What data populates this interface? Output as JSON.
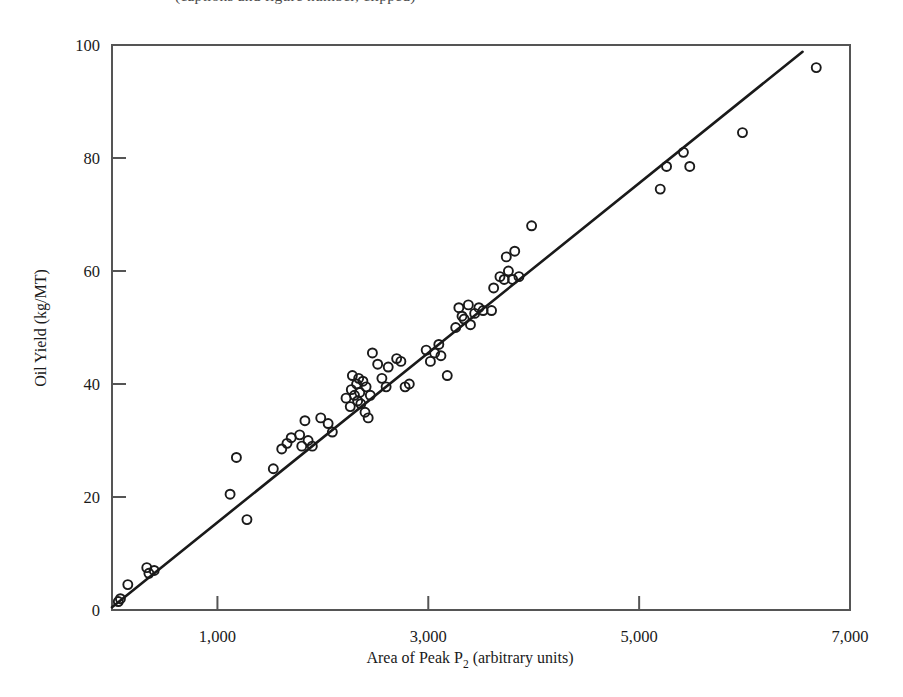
{
  "figure": {
    "partial_caption_above": "(captions and figure number, clipped)",
    "background_color": "#ffffff",
    "marker_color": "#1a1a1a",
    "line_color": "#1a1a1a",
    "frame_color": "#555555"
  },
  "chart_data": {
    "type": "scatter",
    "title": "",
    "xlabel": "Area of Peak P2 (arbitrary units)",
    "xlabel_prefix": "Area of Peak P",
    "xlabel_subscript": "2",
    "xlabel_suffix": " (arbitrary units)",
    "ylabel": "Oil Yield (kg/MT)",
    "xlim": [
      0,
      7000
    ],
    "ylim": [
      0,
      100
    ],
    "xticks": [
      1000,
      3000,
      5000,
      7000
    ],
    "xticklabels": [
      "1,000",
      "3,000",
      "5,000",
      "7,000"
    ],
    "yticks": [
      0,
      20,
      40,
      60,
      80,
      100
    ],
    "yticklabels": [
      "0",
      "20",
      "40",
      "60",
      "80",
      "100"
    ],
    "grid": false,
    "legend": null,
    "marker": "open-circle",
    "marker_size_px": 9,
    "fit_line": {
      "label": "least-squares regression line",
      "x_start": 0,
      "y_start": 0.5,
      "x_end": 6550,
      "y_end": 98.8
    },
    "n_points": 75,
    "points": [
      [
        60,
        1.5
      ],
      [
        80,
        2.0
      ],
      [
        150,
        4.5
      ],
      [
        330,
        7.5
      ],
      [
        350,
        6.5
      ],
      [
        400,
        7.0
      ],
      [
        1120,
        20.5
      ],
      [
        1180,
        27.0
      ],
      [
        1280,
        16.0
      ],
      [
        1530,
        25.0
      ],
      [
        1610,
        28.5
      ],
      [
        1660,
        29.5
      ],
      [
        1700,
        30.5
      ],
      [
        1780,
        31.0
      ],
      [
        1800,
        29.0
      ],
      [
        1830,
        33.5
      ],
      [
        1860,
        30.0
      ],
      [
        1900,
        29.0
      ],
      [
        1980,
        34.0
      ],
      [
        2050,
        33.0
      ],
      [
        2090,
        31.5
      ],
      [
        2220,
        37.5
      ],
      [
        2260,
        36.0
      ],
      [
        2270,
        39.0
      ],
      [
        2280,
        41.5
      ],
      [
        2300,
        38.0
      ],
      [
        2320,
        40.0
      ],
      [
        2330,
        37.0
      ],
      [
        2340,
        41.0
      ],
      [
        2350,
        38.5
      ],
      [
        2360,
        36.5
      ],
      [
        2380,
        40.5
      ],
      [
        2400,
        35.0
      ],
      [
        2410,
        39.5
      ],
      [
        2430,
        34.0
      ],
      [
        2450,
        38.0
      ],
      [
        2470,
        45.5
      ],
      [
        2520,
        43.5
      ],
      [
        2560,
        41.0
      ],
      [
        2600,
        39.5
      ],
      [
        2620,
        43.0
      ],
      [
        2700,
        44.5
      ],
      [
        2740,
        44.0
      ],
      [
        2780,
        39.5
      ],
      [
        2820,
        40.0
      ],
      [
        2980,
        46.0
      ],
      [
        3020,
        44.0
      ],
      [
        3060,
        45.5
      ],
      [
        3100,
        47.0
      ],
      [
        3120,
        45.0
      ],
      [
        3180,
        41.5
      ],
      [
        3260,
        50.0
      ],
      [
        3290,
        53.5
      ],
      [
        3320,
        52.0
      ],
      [
        3340,
        51.5
      ],
      [
        3380,
        54.0
      ],
      [
        3400,
        50.5
      ],
      [
        3440,
        52.5
      ],
      [
        3480,
        53.5
      ],
      [
        3520,
        53.0
      ],
      [
        3600,
        53.0
      ],
      [
        3620,
        57.0
      ],
      [
        3680,
        59.0
      ],
      [
        3720,
        58.5
      ],
      [
        3740,
        62.5
      ],
      [
        3760,
        60.0
      ],
      [
        3800,
        58.5
      ],
      [
        3820,
        63.5
      ],
      [
        3860,
        59.0
      ],
      [
        3980,
        68.0
      ],
      [
        5200,
        74.5
      ],
      [
        5260,
        78.5
      ],
      [
        5420,
        81.0
      ],
      [
        5480,
        78.5
      ],
      [
        5980,
        84.5
      ],
      [
        6680,
        96.0
      ]
    ]
  }
}
